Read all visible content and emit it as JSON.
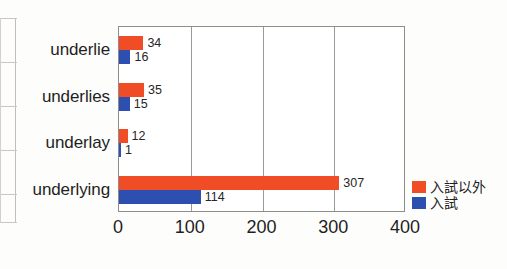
{
  "chart_data": {
    "type": "bar",
    "orientation": "horizontal",
    "title": "",
    "xlabel": "",
    "ylabel": "",
    "categories": [
      "underlie",
      "underlies",
      "underlay",
      "underlying"
    ],
    "series": [
      {
        "name": "入試以外",
        "color": "#f04c26",
        "values": [
          34,
          35,
          12,
          307
        ]
      },
      {
        "name": "入試",
        "color": "#2d4fb0",
        "values": [
          16,
          15,
          1,
          114
        ]
      }
    ],
    "xlim": [
      0,
      400
    ],
    "xticks": [
      0,
      100,
      200,
      300,
      400
    ],
    "xtick_labels": [
      "0",
      "100",
      "200",
      "300",
      "400"
    ],
    "gridlines": [
      100,
      200,
      300
    ],
    "grid": true,
    "legend_position": "right",
    "data_labels": true
  },
  "legend": {
    "items": [
      {
        "label": "入試以外",
        "color": "#f04c26"
      },
      {
        "label": "入試",
        "color": "#2d4fb0"
      }
    ]
  },
  "colors": {
    "series_non_exam": "#f04c26",
    "series_exam": "#2d4fb0",
    "axis": "#8d8d8d",
    "grid": "#9a9a9a",
    "text": "#1f1f1f",
    "background": "#fdfdfc"
  }
}
